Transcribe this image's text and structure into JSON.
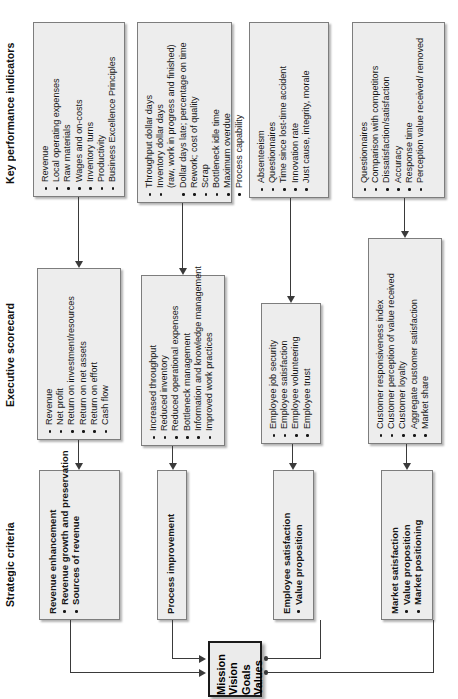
{
  "diagram": {
    "bands": [
      {
        "id": "kpi",
        "label": "Key performance indicators"
      },
      {
        "id": "scorecard",
        "label": "Executive scorecard"
      },
      {
        "id": "criteria",
        "label": "Strategic criteria"
      }
    ],
    "core_box": {
      "name": "mission-vision-goals-values",
      "lines": [
        "Mission",
        "Vision",
        "Goals",
        "Values"
      ]
    },
    "columns": [
      {
        "id": "revenue",
        "kpi": {
          "items": [
            "Revenue",
            "Local operating expenses",
            "Raw materials",
            "Wages and on-costs",
            "Inventory turns",
            "Productivity",
            "Business Excellence Principles"
          ]
        },
        "scorecard": {
          "items": [
            "Revenue",
            "Net profit",
            "Return on investment/resources",
            "Return on net assets",
            "Return on effort",
            "Cash flow"
          ]
        },
        "criteria": {
          "heading": "Revenue enhancement",
          "items": [
            "Revenue growth and preservation",
            "Sources of revenue"
          ]
        }
      },
      {
        "id": "process",
        "kpi": {
          "items": [
            "Throughput dollar days",
            "Inventory dollar days",
            "(raw, work in progress and finished)",
            "Dollar days late; percentage on time",
            "Rework; cost of quality",
            "Scrap",
            "Bottleneck idle time",
            "Maximum overdue",
            "Process capability"
          ]
        },
        "scorecard": {
          "items": [
            "Increased throughput",
            "Reduced inventory",
            "Reduced operational expenses",
            "Bottleneck management",
            "Information and knowledge management",
            "Improved work practices"
          ]
        },
        "criteria": {
          "heading": "Process improvement",
          "items": []
        }
      },
      {
        "id": "employee",
        "kpi": {
          "items": [
            "Absenteeism",
            "Questionnaires",
            "Time since lost-time accident",
            "Innovation rate",
            "Just cause, integrity, morale"
          ]
        },
        "scorecard": {
          "items": [
            "Employee job security",
            "Employee satisfaction",
            "Employee volunteering",
            "Employee trust"
          ]
        },
        "criteria": {
          "heading": "Employee satisfaction",
          "items": [
            "Value proposition"
          ]
        }
      },
      {
        "id": "market",
        "kpi": {
          "items": [
            "Questionnaires",
            "Comparison with competitors",
            "Dissatisfaction/satisfaction",
            "Accuracy",
            "Response time",
            "Perception value received/ removed"
          ]
        },
        "scorecard": {
          "items": [
            "Customer responsiveness index",
            "Customer perception of value received",
            "Customer loyalty",
            "Aggregate customer satisfaction",
            "Market share"
          ]
        },
        "criteria": {
          "heading": "Market satisfaction",
          "items": [
            "Value proposition",
            "Market positioning"
          ]
        }
      }
    ],
    "colors": {
      "box_fill": "#ededed",
      "box_border": "#7d7d7d",
      "core_border": "#1a1a1a",
      "connector": "#3a3a3a",
      "text": "#161616"
    }
  }
}
